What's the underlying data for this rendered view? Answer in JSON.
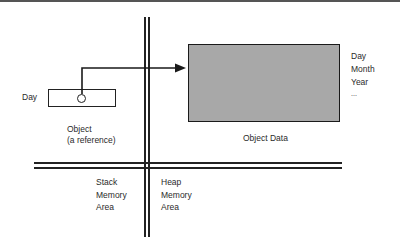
{
  "diagram": {
    "reference": {
      "variable_label": "Day",
      "caption_line1": "Object",
      "caption_line2": "(a reference)"
    },
    "object_data": {
      "caption": "Object Data",
      "fields": [
        "Day",
        "Month",
        "Year",
        "..."
      ]
    },
    "regions": {
      "stack": [
        "Stack",
        "Memory",
        "Area"
      ],
      "heap": [
        "Heap",
        "Memory",
        "Area"
      ]
    },
    "colors": {
      "object_fill": "#a8a8a8",
      "line": "#222222"
    }
  }
}
